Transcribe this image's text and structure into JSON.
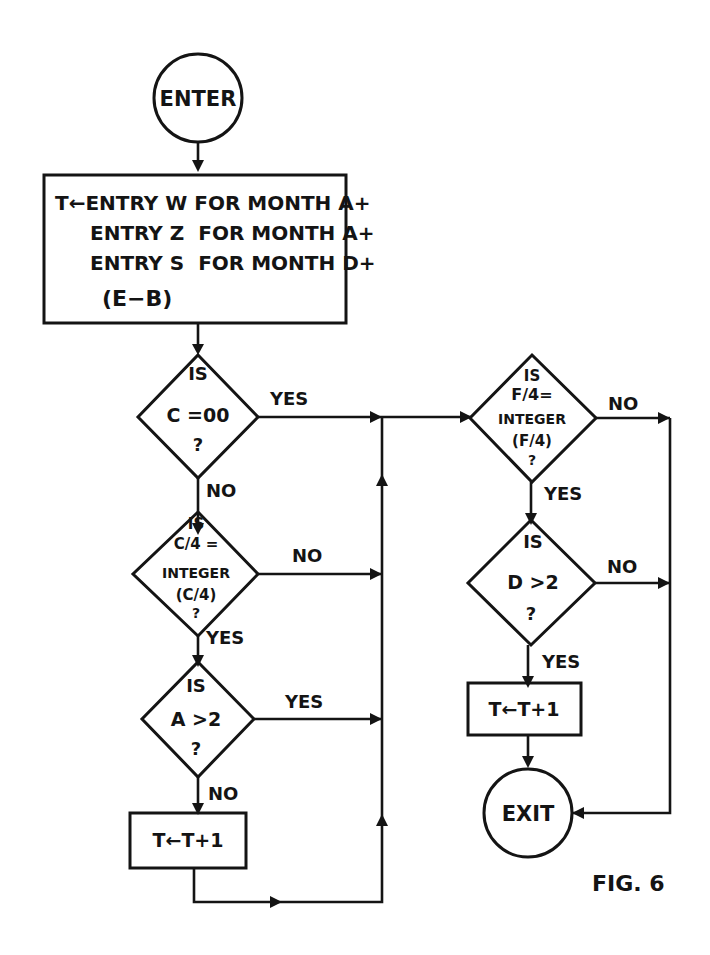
{
  "diagram": {
    "figure_label": "FIG. 6",
    "nodes": {
      "enter": {
        "label": "ENTER",
        "type": "terminal"
      },
      "compute": {
        "type": "process",
        "lines": [
          "T←ENTRY W FOR MONTH A+",
          "ENTRY Z  FOR MONTH A+",
          "ENTRY S  FOR MONTH D+",
          "(E−B)"
        ]
      },
      "is_c_00": {
        "type": "decision",
        "lines": [
          "IS",
          "C =00",
          "?"
        ]
      },
      "is_c4_integer": {
        "type": "decision",
        "lines": [
          "IS",
          "C/4 =",
          "INTEGER",
          "(C/4)",
          "?"
        ]
      },
      "is_a_gt_2": {
        "type": "decision",
        "lines": [
          "IS",
          "A >2",
          "?"
        ]
      },
      "increment_left": {
        "type": "process",
        "label": "T←T+1"
      },
      "is_f4_integer": {
        "type": "decision",
        "lines": [
          "IS",
          "F/4=",
          "INTEGER",
          "(F/4)",
          "?"
        ]
      },
      "is_d_gt_2": {
        "type": "decision",
        "lines": [
          "IS",
          "D >2",
          "?"
        ]
      },
      "increment_right": {
        "type": "process",
        "label": "T←T+1"
      },
      "exit": {
        "label": "EXIT",
        "type": "terminal"
      }
    },
    "edges": {
      "c00_yes": "YES",
      "c00_no": "NO",
      "c4_no": "NO",
      "c4_yes": "YES",
      "a2_yes": "YES",
      "a2_no": "NO",
      "f4_no": "NO",
      "f4_yes": "YES",
      "d2_no": "NO",
      "d2_yes": "YES"
    },
    "stroke_color": "#141414",
    "background": "#ffffff"
  }
}
